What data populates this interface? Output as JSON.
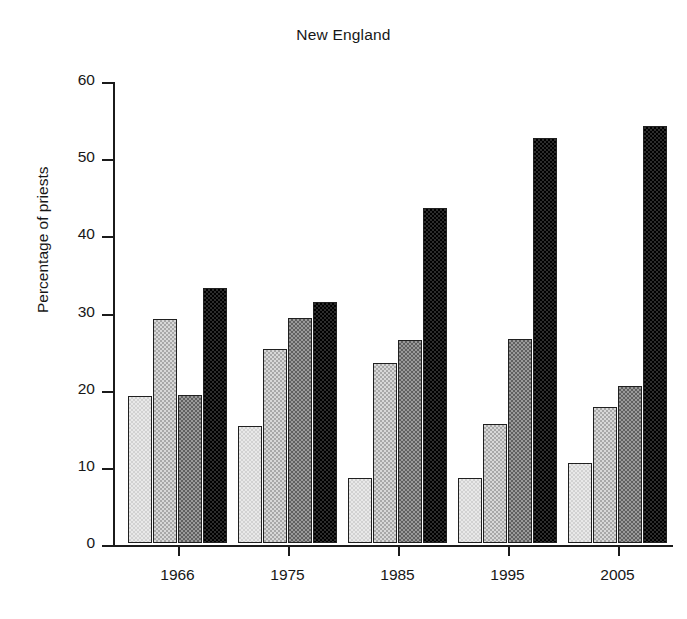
{
  "chart_data": {
    "type": "bar",
    "title": "New England",
    "xlabel": "",
    "ylabel": "Percentage of priests",
    "categories": [
      "1966",
      "1975",
      "1985",
      "1995",
      "2005"
    ],
    "ylim": [
      0,
      60
    ],
    "yticks": [
      0,
      10,
      20,
      30,
      40,
      50,
      60
    ],
    "ytick_labels": [
      "0",
      "10",
      "20",
      "30",
      "40",
      "50",
      "60"
    ],
    "grid": false,
    "legend": "none",
    "series": [
      {
        "name": "series-1",
        "shade": "very-light-grey",
        "color": "#e9e9e9",
        "values": [
          19.1,
          15.1,
          8.4,
          8.4,
          10.4
        ]
      },
      {
        "name": "series-2",
        "shade": "light-grey",
        "color": "#d8d8d8",
        "values": [
          29.0,
          25.2,
          23.3,
          15.4,
          17.6
        ]
      },
      {
        "name": "series-3",
        "shade": "mid-grey",
        "color": "#9a9a9a",
        "values": [
          19.2,
          29.2,
          26.3,
          26.4,
          20.4
        ]
      },
      {
        "name": "series-4",
        "shade": "near-black",
        "color": "#2c2c2c",
        "values": [
          33.1,
          31.2,
          43.4,
          52.5,
          54.1
        ]
      }
    ]
  },
  "axes": {
    "y_axis_title": "Percentage of priests",
    "y_tick_labels": [
      "60",
      "50",
      "40",
      "30",
      "20",
      "10",
      "0"
    ],
    "x_tick_labels": [
      "1966",
      "1975",
      "1985",
      "1995",
      "2005"
    ]
  },
  "title": "New England"
}
